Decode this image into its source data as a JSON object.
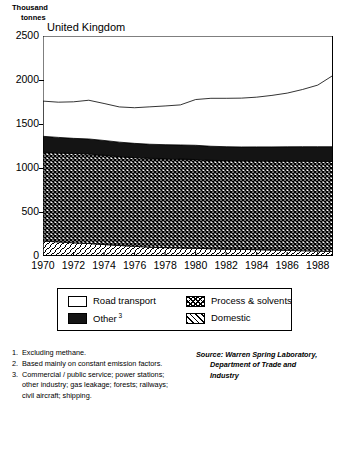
{
  "chart_data": {
    "type": "area",
    "title": "United Kingdom",
    "ylabel_line1": "Thousand",
    "ylabel_line2": "tonnes",
    "xlabel": "",
    "ylim": [
      0,
      2500
    ],
    "yticks": [
      2500,
      2000,
      1500,
      1000,
      500,
      0
    ],
    "xlim": [
      1970,
      1989
    ],
    "xticks": [
      1970,
      1972,
      1974,
      1976,
      1978,
      1980,
      1982,
      1984,
      1986,
      1988
    ],
    "grid": false,
    "stacked": true,
    "legend_position": "below-plot",
    "x": [
      1970,
      1971,
      1972,
      1973,
      1974,
      1975,
      1976,
      1977,
      1978,
      1979,
      1980,
      1981,
      1982,
      1983,
      1984,
      1985,
      1986,
      1987,
      1988,
      1989
    ],
    "series": [
      {
        "name": "Domestic",
        "fill": "diagonal-hatch",
        "values": [
          170,
          160,
          150,
          142,
          130,
          120,
          110,
          100,
          95,
          92,
          88,
          82,
          78,
          75,
          72,
          68,
          64,
          60,
          56,
          52
        ]
      },
      {
        "name": "Process & solvents",
        "fill": "crosshatch",
        "values": [
          1010,
          1012,
          1015,
          1018,
          1015,
          1010,
          1008,
          1010,
          1012,
          1010,
          1008,
          1005,
          1006,
          1008,
          1010,
          1012,
          1015,
          1018,
          1020,
          1022
        ]
      },
      {
        "name": "Other 3",
        "fill": "solid-dark",
        "values": [
          180,
          176,
          172,
          170,
          168,
          164,
          162,
          160,
          158,
          160,
          162,
          160,
          158,
          156,
          158,
          160,
          162,
          164,
          166,
          168
        ]
      },
      {
        "name": "Road transport",
        "fill": "white",
        "values": [
          400,
          400,
          415,
          440,
          420,
          400,
          405,
          425,
          440,
          455,
          520,
          545,
          550,
          555,
          565,
          585,
          610,
          650,
          700,
          810
        ]
      }
    ],
    "totals": [
      1760,
      1748,
      1752,
      1770,
      1733,
      1694,
      1685,
      1695,
      1705,
      1717,
      1778,
      1792,
      1792,
      1794,
      1805,
      1825,
      1851,
      1892,
      1942,
      2052
    ]
  },
  "legend": {
    "items": [
      {
        "label": "Road transport",
        "swatch": "white",
        "sup": ""
      },
      {
        "label": "Other",
        "swatch": "solid-dark",
        "sup": "3"
      },
      {
        "label": "Process & solvents",
        "swatch": "crosshatch",
        "sup": ""
      },
      {
        "label": "Domestic",
        "swatch": "diagonal-hatch",
        "sup": ""
      }
    ]
  },
  "footnotes": [
    {
      "num": "1.",
      "text": "Excluding methane."
    },
    {
      "num": "2.",
      "text": "Based mainly on constant emission factors."
    },
    {
      "num": "3.",
      "text": "Commercial / public service; power stations; other industry; gas leakage; forests; railways; civil aircraft; shipping."
    }
  ],
  "source": {
    "line1": "Source: Warren Spring Laboratory,",
    "line2": "Department of Trade and",
    "line3": "Industry"
  }
}
